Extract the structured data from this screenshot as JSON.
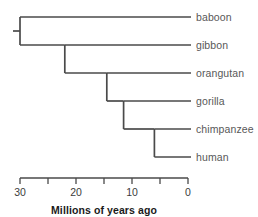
{
  "chart_data": {
    "type": "tree",
    "title": "",
    "xlabel": "Millions of years ago",
    "ylabel": "",
    "axis": {
      "orientation": "horizontal-reversed",
      "min": 0,
      "max": 30,
      "tick_interval": 5,
      "ticks": [
        30,
        25,
        20,
        15,
        10,
        5,
        0
      ],
      "tick_labels": [
        "30",
        "",
        "20",
        "",
        "10",
        "",
        "0"
      ],
      "grid": false
    },
    "taxa": [
      {
        "name": "baboon",
        "row": 0
      },
      {
        "name": "gibbon",
        "row": 1
      },
      {
        "name": "orangutan",
        "row": 2
      },
      {
        "name": "gorilla",
        "row": 3
      },
      {
        "name": "chimpanzee",
        "row": 4
      },
      {
        "name": "human",
        "row": 5
      }
    ],
    "nodes": [
      {
        "id": "root",
        "divergence_mya": 30.0,
        "children": [
          "baboon",
          "n_gibbon"
        ]
      },
      {
        "id": "n_gibbon",
        "divergence_mya": 22.0,
        "children": [
          "gibbon",
          "n_orangutan"
        ]
      },
      {
        "id": "n_orangutan",
        "divergence_mya": 14.5,
        "children": [
          "orangutan",
          "n_gorilla"
        ]
      },
      {
        "id": "n_gorilla",
        "divergence_mya": 11.5,
        "children": [
          "gorilla",
          "n_chimp_human"
        ]
      },
      {
        "id": "n_chimp_human",
        "divergence_mya": 6.0,
        "children": [
          "chimpanzee",
          "human"
        ]
      }
    ],
    "legend": [],
    "annotations": []
  },
  "style": {
    "line_color": "#4a4a4a",
    "axis_color": "#4a4a4a",
    "label_color": "#585858",
    "tick_label_color": "#3c3c3c",
    "axis_title_color": "#1a1a1a",
    "background": "#ffffff"
  }
}
